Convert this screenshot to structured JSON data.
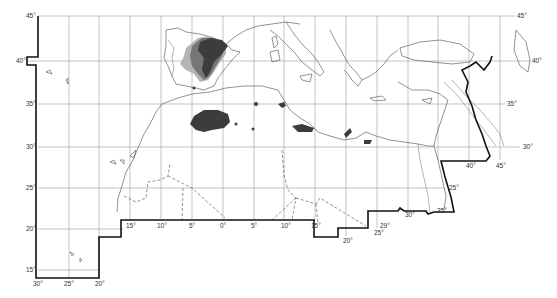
{
  "map": {
    "title": "Distribution map — Mediterranean / North Africa / Near East",
    "latitude_labels": {
      "left": [
        {
          "label": "45°",
          "y": 16
        },
        {
          "label": "40°",
          "y": 61
        },
        {
          "label": "35°",
          "y": 104
        },
        {
          "label": "30°",
          "y": 147
        },
        {
          "label": "25°",
          "y": 188
        },
        {
          "label": "20°",
          "y": 229
        },
        {
          "label": "15°",
          "y": 270
        }
      ],
      "right": [
        {
          "label": "45°",
          "x": 515,
          "y": 16
        },
        {
          "label": "40°",
          "x": 534,
          "y": 61
        },
        {
          "label": "35°",
          "x": 507,
          "y": 104
        },
        {
          "label": "30°",
          "x": 523,
          "y": 147
        },
        {
          "label": "25°",
          "x": 449,
          "y": 188
        }
      ]
    },
    "longitude_labels": {
      "bottom_main": [
        {
          "label": "15°",
          "x": 129
        },
        {
          "label": "10°",
          "x": 160
        },
        {
          "label": "5°",
          "x": 190
        },
        {
          "label": "0°",
          "x": 221
        },
        {
          "label": "5°",
          "x": 252
        },
        {
          "label": "10°",
          "x": 283
        },
        {
          "label": "15°",
          "x": 313
        }
      ],
      "bottom_sw": [
        {
          "label": "30°",
          "x": 37
        },
        {
          "label": "25°",
          "x": 67
        },
        {
          "label": "20°",
          "x": 98
        }
      ],
      "bottom_se": [
        {
          "label": "20°",
          "x": 346,
          "y": 241
        },
        {
          "label": "25°",
          "x": 377,
          "y": 234
        },
        {
          "label": "29°",
          "x": 381,
          "y": 227
        },
        {
          "label": "30°",
          "x": 405,
          "y": 216
        },
        {
          "label": "35°",
          "x": 437,
          "y": 212
        },
        {
          "label": "40°",
          "x": 468,
          "y": 167
        },
        {
          "label": "45°",
          "x": 498,
          "y": 167
        }
      ]
    },
    "legend": {
      "shades": [
        {
          "name": "dark",
          "color": "#3c3c3c"
        },
        {
          "name": "medium",
          "color": "#767676"
        },
        {
          "name": "light",
          "color": "#b4b4b4"
        }
      ]
    },
    "colors": {
      "background": "#ffffff",
      "frame": "#111111",
      "grid": "#9a9a9a",
      "coastline": "#4a4a4a"
    }
  }
}
